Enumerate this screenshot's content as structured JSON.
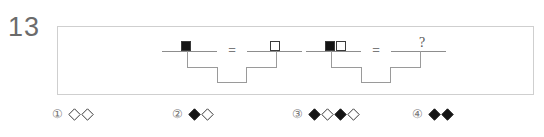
{
  "problem": {
    "number": "13"
  },
  "panel": {
    "scales": [
      {
        "id": "scale-1",
        "relation": "=",
        "relation_icon": "equals-icon",
        "left_pan": {
          "label": "black-square",
          "weights": [
            {
              "fill": "filled",
              "icon": "filled-square-icon"
            }
          ]
        },
        "right_pan": {
          "label": "white-square",
          "weights": [
            {
              "fill": "open",
              "icon": "open-square-icon"
            }
          ]
        }
      },
      {
        "id": "scale-2",
        "relation": "=",
        "relation_icon": "equals-icon",
        "left_pan": {
          "label": "black-square-and-white-square",
          "weights": [
            {
              "fill": "filled",
              "icon": "filled-square-icon"
            },
            {
              "fill": "open",
              "icon": "open-square-icon"
            }
          ]
        },
        "right_pan": {
          "label": "unknown",
          "unknown_mark": "?",
          "weights": []
        }
      }
    ]
  },
  "options": [
    {
      "number": "①",
      "shapes": [
        {
          "fill": "open",
          "icon": "open-diamond-icon"
        },
        {
          "fill": "open",
          "icon": "open-diamond-icon"
        }
      ]
    },
    {
      "number": "②",
      "shapes": [
        {
          "fill": "filled",
          "icon": "filled-diamond-icon"
        },
        {
          "fill": "open",
          "icon": "open-diamond-icon"
        }
      ]
    },
    {
      "number": "③",
      "shapes": [
        {
          "fill": "filled",
          "icon": "filled-diamond-icon"
        },
        {
          "fill": "open",
          "icon": "open-diamond-icon"
        },
        {
          "fill": "filled",
          "icon": "filled-diamond-icon"
        },
        {
          "fill": "open",
          "icon": "open-diamond-icon"
        }
      ]
    },
    {
      "number": "④",
      "shapes": [
        {
          "fill": "filled",
          "icon": "filled-diamond-icon"
        },
        {
          "fill": "filled",
          "icon": "filled-diamond-icon"
        }
      ]
    }
  ],
  "colors": {
    "panel_border": "#cfcfcf",
    "scale_line": "#9a9a9a",
    "shape_stroke": "#3a3a3a",
    "shape_fill": "#141414",
    "number_color": "#6b6b6b",
    "option_text": "#777777"
  }
}
